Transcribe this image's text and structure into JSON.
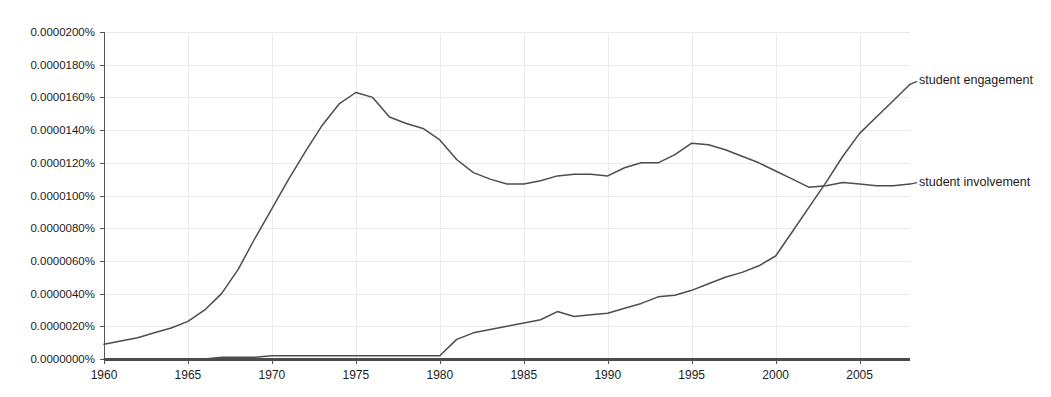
{
  "chart_data": {
    "type": "line",
    "title": "",
    "subtitle": "",
    "xlabel": "",
    "ylabel": "",
    "xlim": [
      1960,
      2008
    ],
    "ylim": [
      0.0,
      2e-05
    ],
    "grid": true,
    "legend_position": "right-inline",
    "x_tick_labels": [
      "1960",
      "1965",
      "1970",
      "1975",
      "1980",
      "1985",
      "1990",
      "1995",
      "2000",
      "2005"
    ],
    "x_ticks": [
      1960,
      1965,
      1970,
      1975,
      1980,
      1985,
      1990,
      1995,
      2000,
      2005
    ],
    "y_tick_labels": [
      "0.0000000%",
      "0.0000020%",
      "0.0000040%",
      "0.0000060%",
      "0.0000080%",
      "0.0000100%",
      "0.0000120%",
      "0.0000140%",
      "0.0000160%",
      "0.0000180%",
      "0.0000200%"
    ],
    "y_ticks": [
      0.0,
      2e-06,
      4e-06,
      6e-06,
      8e-06,
      1e-05,
      1.2e-05,
      1.4e-05,
      1.6e-05,
      1.8e-05,
      2e-05
    ],
    "x": [
      1960,
      1961,
      1962,
      1963,
      1964,
      1965,
      1966,
      1967,
      1968,
      1969,
      1970,
      1971,
      1972,
      1973,
      1974,
      1975,
      1976,
      1977,
      1978,
      1979,
      1980,
      1981,
      1982,
      1983,
      1984,
      1985,
      1986,
      1987,
      1988,
      1989,
      1990,
      1991,
      1992,
      1993,
      1994,
      1995,
      1996,
      1997,
      1998,
      1999,
      2000,
      2001,
      2002,
      2003,
      2004,
      2005,
      2006,
      2007,
      2008
    ],
    "series": [
      {
        "name": "student involvement",
        "color": "#4d4d4d",
        "label_x": 2008,
        "label_y": 1.06e-05,
        "values": [
          9e-07,
          1.1e-06,
          1.3e-06,
          1.6e-06,
          1.9e-06,
          2.3e-06,
          3e-06,
          4e-06,
          5.5e-06,
          7.4e-06,
          9.2e-06,
          1.1e-05,
          1.27e-05,
          1.43e-05,
          1.56e-05,
          1.63e-05,
          1.6e-05,
          1.48e-05,
          1.44e-05,
          1.41e-05,
          1.34e-05,
          1.22e-05,
          1.14e-05,
          1.1e-05,
          1.07e-05,
          1.07e-05,
          1.09e-05,
          1.12e-05,
          1.13e-05,
          1.13e-05,
          1.12e-05,
          1.17e-05,
          1.2e-05,
          1.2e-05,
          1.25e-05,
          1.32e-05,
          1.31e-05,
          1.28e-05,
          1.24e-05,
          1.2e-05,
          1.15e-05,
          1.1e-05,
          1.05e-05,
          1.06e-05,
          1.08e-05,
          1.07e-05,
          1.06e-05,
          1.06e-05,
          1.07e-05
        ]
      },
      {
        "name": "student engagement",
        "color": "#4d4d4d",
        "label_x": 2008,
        "label_y": 1.68e-05,
        "values": [
          0.0,
          0.0,
          0.0,
          0.0,
          0.0,
          0.0,
          0.0,
          1e-07,
          1e-07,
          1e-07,
          2e-07,
          2e-07,
          2e-07,
          2e-07,
          2e-07,
          2e-07,
          2e-07,
          2e-07,
          2e-07,
          2e-07,
          2e-07,
          1.2e-06,
          1.6e-06,
          1.8e-06,
          2e-06,
          2.2e-06,
          2.4e-06,
          2.9e-06,
          2.6e-06,
          2.7e-06,
          2.8e-06,
          3.1e-06,
          3.4e-06,
          3.8e-06,
          3.9e-06,
          4.2e-06,
          4.6e-06,
          5e-06,
          5.3e-06,
          5.7e-06,
          6.3e-06,
          7.8e-06,
          9.3e-06,
          1.08e-05,
          1.24e-05,
          1.38e-05,
          1.48e-05,
          1.58e-05,
          1.68e-05
        ]
      }
    ]
  },
  "axes": {
    "y_axis_name": "ngram-frequency-percent",
    "x_axis_name": "year"
  }
}
